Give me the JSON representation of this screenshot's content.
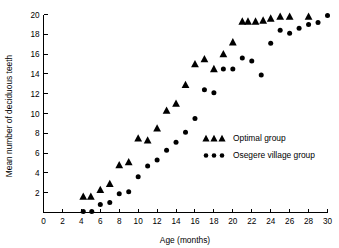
{
  "chart_data": {
    "type": "scatter",
    "title": "",
    "xlabel": "Age (months)",
    "ylabel": "Mean number of deciduous teeth",
    "xlim": [
      0,
      30
    ],
    "ylim": [
      0,
      20
    ],
    "xticks": [
      0,
      2,
      4,
      6,
      8,
      10,
      12,
      14,
      16,
      18,
      20,
      22,
      24,
      26,
      28,
      30
    ],
    "yticks": [
      0,
      2,
      4,
      6,
      8,
      10,
      12,
      14,
      16,
      18,
      20
    ],
    "grid": false,
    "legend_position": "center-right",
    "series": [
      {
        "name": "Optimal group",
        "marker": "triangle",
        "color": "#000000",
        "points": [
          [
            4.2,
            1.6
          ],
          [
            5.0,
            1.6
          ],
          [
            6.0,
            2.3
          ],
          [
            7.0,
            2.9
          ],
          [
            8.0,
            4.8
          ],
          [
            9.0,
            5.1
          ],
          [
            10.0,
            7.5
          ],
          [
            11.0,
            7.3
          ],
          [
            12.0,
            8.5
          ],
          [
            13.0,
            10.3
          ],
          [
            14.0,
            11.0
          ],
          [
            15.0,
            12.9
          ],
          [
            16.0,
            15.0
          ],
          [
            17.0,
            15.5
          ],
          [
            18.0,
            14.5
          ],
          [
            19.0,
            16.0
          ],
          [
            20.0,
            17.2
          ],
          [
            21.0,
            19.3
          ],
          [
            21.6,
            19.3
          ],
          [
            22.4,
            19.3
          ],
          [
            23.2,
            19.4
          ],
          [
            24.0,
            19.6
          ],
          [
            25.0,
            19.8
          ],
          [
            26.0,
            19.8
          ],
          [
            28.0,
            19.8
          ]
        ]
      },
      {
        "name": "Osegere village group",
        "marker": "circle",
        "color": "#000000",
        "points": [
          [
            4.2,
            0.1
          ],
          [
            5.1,
            0.1
          ],
          [
            6.0,
            0.8
          ],
          [
            7.0,
            1.0
          ],
          [
            8.0,
            1.9
          ],
          [
            9.0,
            2.1
          ],
          [
            10.0,
            3.6
          ],
          [
            11.0,
            4.7
          ],
          [
            12.0,
            5.3
          ],
          [
            13.0,
            6.3
          ],
          [
            14.0,
            7.1
          ],
          [
            15.0,
            8.1
          ],
          [
            16.0,
            9.5
          ],
          [
            17.0,
            12.4
          ],
          [
            18.0,
            12.1
          ],
          [
            19.0,
            14.5
          ],
          [
            20.0,
            14.5
          ],
          [
            21.0,
            15.6
          ],
          [
            22.0,
            15.3
          ],
          [
            23.0,
            13.9
          ],
          [
            24.0,
            17.1
          ],
          [
            25.0,
            18.4
          ],
          [
            26.0,
            18.1
          ],
          [
            27.0,
            18.6
          ],
          [
            28.0,
            19.0
          ],
          [
            29.0,
            19.2
          ],
          [
            30.0,
            19.9
          ]
        ]
      }
    ],
    "legend": [
      {
        "label": "Optimal group",
        "marker": "triangle"
      },
      {
        "label": "Osegere village group",
        "marker": "circle"
      }
    ]
  }
}
